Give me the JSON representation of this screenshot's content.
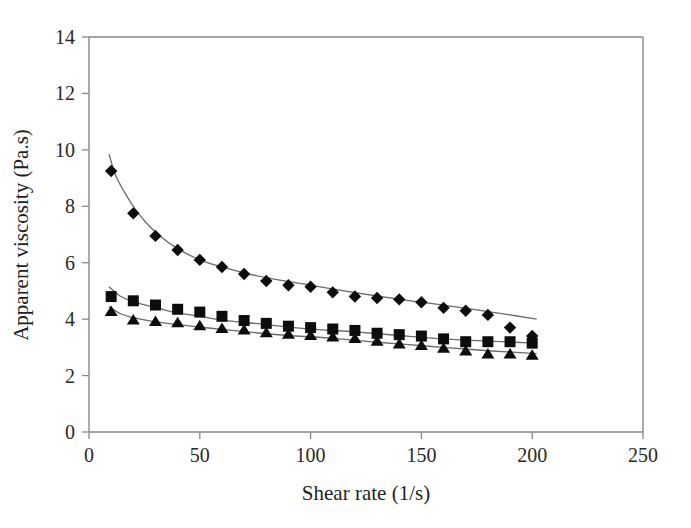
{
  "chart_data": {
    "type": "scatter",
    "title": "",
    "xlabel": "Shear rate (1/s)",
    "ylabel": "Apparent viscosity (Pa.s)",
    "xlim": [
      0,
      250
    ],
    "ylim": [
      0,
      14
    ],
    "xticks": [
      0,
      50,
      100,
      150,
      200,
      250
    ],
    "yticks": [
      0,
      2,
      4,
      6,
      8,
      10,
      12,
      14
    ],
    "grid": false,
    "legend": "none",
    "frame": "left-top-box",
    "series": [
      {
        "name": "series-diamond",
        "marker": "diamond",
        "color": "#0d0d0d",
        "fitted_curve": true,
        "x": [
          10,
          20,
          30,
          40,
          50,
          60,
          70,
          80,
          90,
          100,
          110,
          120,
          130,
          140,
          150,
          160,
          170,
          180,
          190,
          200
        ],
        "y": [
          9.25,
          7.75,
          6.95,
          6.45,
          6.1,
          5.85,
          5.6,
          5.35,
          5.2,
          5.15,
          4.95,
          4.8,
          4.75,
          4.7,
          4.6,
          4.4,
          4.3,
          4.15,
          3.7,
          3.4
        ]
      },
      {
        "name": "series-square",
        "marker": "square",
        "color": "#0d0d0d",
        "fitted_curve": true,
        "x": [
          10,
          20,
          30,
          40,
          50,
          60,
          70,
          80,
          90,
          100,
          110,
          120,
          130,
          140,
          150,
          160,
          170,
          180,
          190,
          200
        ],
        "y": [
          4.8,
          4.65,
          4.5,
          4.35,
          4.25,
          4.1,
          3.95,
          3.85,
          3.75,
          3.7,
          3.65,
          3.6,
          3.5,
          3.45,
          3.4,
          3.3,
          3.2,
          3.2,
          3.2,
          3.15
        ]
      },
      {
        "name": "series-triangle",
        "marker": "triangle",
        "color": "#0d0d0d",
        "fitted_curve": true,
        "x": [
          10,
          20,
          30,
          40,
          50,
          60,
          70,
          80,
          90,
          100,
          110,
          120,
          130,
          140,
          150,
          160,
          170,
          180,
          190,
          200
        ],
        "y": [
          4.25,
          3.95,
          3.9,
          3.85,
          3.75,
          3.65,
          3.6,
          3.5,
          3.45,
          3.4,
          3.35,
          3.3,
          3.2,
          3.1,
          3.05,
          2.95,
          2.85,
          2.75,
          2.75,
          2.7
        ]
      }
    ],
    "fit_curves": [
      {
        "name": "fit-diamond",
        "points": [
          [
            9,
            9.85
          ],
          [
            12,
            9.1
          ],
          [
            16,
            8.5
          ],
          [
            20,
            8.0
          ],
          [
            26,
            7.4
          ],
          [
            32,
            6.95
          ],
          [
            40,
            6.5
          ],
          [
            50,
            6.1
          ],
          [
            60,
            5.85
          ],
          [
            72,
            5.6
          ],
          [
            85,
            5.4
          ],
          [
            100,
            5.2
          ],
          [
            115,
            5.0
          ],
          [
            130,
            4.82
          ],
          [
            145,
            4.65
          ],
          [
            160,
            4.5
          ],
          [
            175,
            4.33
          ],
          [
            190,
            4.15
          ],
          [
            202,
            4.0
          ]
        ]
      },
      {
        "name": "fit-square",
        "points": [
          [
            9,
            5.15
          ],
          [
            14,
            4.82
          ],
          [
            20,
            4.62
          ],
          [
            28,
            4.45
          ],
          [
            38,
            4.25
          ],
          [
            50,
            4.1
          ],
          [
            62,
            3.95
          ],
          [
            75,
            3.85
          ],
          [
            90,
            3.72
          ],
          [
            105,
            3.62
          ],
          [
            120,
            3.55
          ],
          [
            140,
            3.42
          ],
          [
            160,
            3.3
          ],
          [
            180,
            3.22
          ],
          [
            202,
            3.15
          ]
        ]
      },
      {
        "name": "fit-triangle",
        "points": [
          [
            9,
            4.45
          ],
          [
            14,
            4.2
          ],
          [
            20,
            4.05
          ],
          [
            28,
            3.93
          ],
          [
            38,
            3.82
          ],
          [
            50,
            3.72
          ],
          [
            62,
            3.62
          ],
          [
            75,
            3.52
          ],
          [
            90,
            3.42
          ],
          [
            105,
            3.35
          ],
          [
            120,
            3.25
          ],
          [
            140,
            3.12
          ],
          [
            160,
            3.0
          ],
          [
            180,
            2.88
          ],
          [
            202,
            2.78
          ]
        ]
      }
    ]
  },
  "axes": {
    "x_title": "Shear rate (1/s)",
    "y_title": "Apparent viscosity (Pa.s)",
    "x_tick_labels": [
      "0",
      "50",
      "100",
      "150",
      "200",
      "250"
    ],
    "y_tick_labels": [
      "0",
      "2",
      "4",
      "6",
      "8",
      "10",
      "12",
      "14"
    ]
  }
}
